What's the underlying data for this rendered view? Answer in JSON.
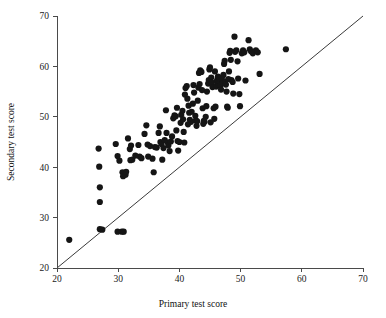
{
  "chart_data": {
    "type": "scatter",
    "title": "",
    "xlabel": "Primary test score",
    "ylabel": "Secondary test score",
    "xlim": [
      20,
      70
    ],
    "ylim": [
      20,
      70
    ],
    "xticks": [
      20,
      30,
      40,
      50,
      60,
      70
    ],
    "yticks": [
      20,
      30,
      40,
      50,
      60,
      70
    ],
    "xtick_labels": [
      "20",
      "30",
      "40",
      "50",
      "60",
      "70"
    ],
    "ytick_labels": [
      "20",
      "30",
      "40",
      "50",
      "60",
      "70"
    ],
    "grid": false,
    "legend": null,
    "marker": {
      "shape": "circle",
      "color": "#151515",
      "size_px": 3.1
    },
    "reference_line": {
      "name": "identity-line",
      "description": "45 degree line y = x",
      "x_start": 20,
      "y_start": 20,
      "x_end": 70,
      "y_end": 70,
      "color": "#3a3a3a",
      "width": 1
    },
    "n_points": 151,
    "points": [
      [
        22.0,
        25.6
      ],
      [
        26.8,
        43.7
      ],
      [
        26.9,
        40.1
      ],
      [
        27.0,
        36.0
      ],
      [
        27.0,
        33.1
      ],
      [
        27.0,
        27.7
      ],
      [
        27.4,
        27.6
      ],
      [
        29.9,
        27.2
      ],
      [
        30.6,
        27.2
      ],
      [
        30.9,
        27.2
      ],
      [
        29.6,
        44.6
      ],
      [
        29.9,
        42.2
      ],
      [
        30.2,
        41.3
      ],
      [
        30.7,
        39.0
      ],
      [
        30.8,
        38.2
      ],
      [
        31.2,
        38.5
      ],
      [
        31.3,
        39.1
      ],
      [
        31.6,
        45.7
      ],
      [
        31.9,
        43.6
      ],
      [
        32.0,
        41.4
      ],
      [
        32.3,
        41.5
      ],
      [
        32.1,
        44.3
      ],
      [
        33.3,
        44.4
      ],
      [
        33.5,
        42.1
      ],
      [
        34.3,
        46.6
      ],
      [
        34.6,
        48.3
      ],
      [
        34.8,
        44.5
      ],
      [
        35.2,
        44.2
      ],
      [
        35.6,
        41.7
      ],
      [
        35.8,
        39.0
      ],
      [
        36.0,
        44.0
      ],
      [
        36.3,
        43.9
      ],
      [
        36.6,
        46.8
      ],
      [
        36.9,
        45.0
      ],
      [
        37.1,
        44.6
      ],
      [
        37.2,
        41.5
      ],
      [
        37.4,
        43.8
      ],
      [
        37.6,
        45.4
      ],
      [
        37.8,
        51.3
      ],
      [
        37.9,
        46.8
      ],
      [
        38.1,
        44.9
      ],
      [
        38.2,
        44.3
      ],
      [
        38.4,
        43.2
      ],
      [
        38.6,
        45.1
      ],
      [
        38.8,
        46.1
      ],
      [
        39.0,
        49.7
      ],
      [
        39.2,
        50.3
      ],
      [
        39.4,
        50.1
      ],
      [
        39.5,
        47.3
      ],
      [
        39.7,
        45.2
      ],
      [
        39.8,
        43.3
      ],
      [
        40.0,
        45.0
      ],
      [
        40.2,
        48.8
      ],
      [
        40.3,
        50.4
      ],
      [
        40.5,
        51.2
      ],
      [
        40.6,
        49.5
      ],
      [
        40.7,
        47.0
      ],
      [
        40.8,
        44.9
      ],
      [
        41.0,
        55.7
      ],
      [
        41.2,
        56.1
      ],
      [
        41.3,
        53.6
      ],
      [
        41.5,
        52.2
      ],
      [
        41.6,
        50.8
      ],
      [
        41.7,
        49.4
      ],
      [
        41.9,
        49.0
      ],
      [
        42.0,
        51.0
      ],
      [
        42.2,
        52.6
      ],
      [
        42.3,
        56.3
      ],
      [
        42.4,
        54.8
      ],
      [
        42.6,
        50.2
      ],
      [
        42.7,
        49.3
      ],
      [
        42.9,
        49.1
      ],
      [
        43.0,
        53.2
      ],
      [
        43.1,
        55.8
      ],
      [
        43.3,
        56.5
      ],
      [
        43.4,
        59.2
      ],
      [
        43.6,
        58.9
      ],
      [
        43.7,
        55.3
      ],
      [
        43.8,
        51.7
      ],
      [
        44.0,
        49.2
      ],
      [
        44.1,
        49.0
      ],
      [
        44.3,
        50.0
      ],
      [
        44.4,
        52.1
      ],
      [
        44.5,
        55.0
      ],
      [
        44.7,
        56.6
      ],
      [
        44.8,
        57.3
      ],
      [
        44.9,
        59.4
      ],
      [
        45.0,
        59.8
      ],
      [
        45.2,
        57.8
      ],
      [
        45.3,
        56.8
      ],
      [
        45.4,
        55.9
      ],
      [
        45.6,
        51.7
      ],
      [
        45.7,
        49.6
      ],
      [
        45.9,
        52.0
      ],
      [
        46.0,
        56.0
      ],
      [
        46.1,
        57.0
      ],
      [
        46.2,
        57.4
      ],
      [
        46.3,
        58.0
      ],
      [
        46.4,
        56.5
      ],
      [
        46.5,
        57.1
      ],
      [
        46.6,
        57.6
      ],
      [
        46.7,
        56.2
      ],
      [
        46.8,
        55.4
      ],
      [
        46.9,
        57.8
      ],
      [
        47.0,
        57.2
      ],
      [
        47.1,
        56.7
      ],
      [
        47.2,
        58.3
      ],
      [
        47.3,
        60.5
      ],
      [
        47.4,
        61.1
      ],
      [
        47.5,
        57.0
      ],
      [
        47.6,
        56.4
      ],
      [
        47.7,
        55.0
      ],
      [
        47.8,
        52.0
      ],
      [
        47.9,
        51.8
      ],
      [
        48.0,
        57.5
      ],
      [
        48.1,
        59.0
      ],
      [
        48.2,
        62.7
      ],
      [
        48.3,
        63.1
      ],
      [
        48.4,
        61.3
      ],
      [
        48.5,
        57.3
      ],
      [
        48.7,
        56.9
      ],
      [
        48.8,
        54.6
      ],
      [
        49.0,
        65.9
      ],
      [
        49.1,
        62.9
      ],
      [
        49.3,
        63.2
      ],
      [
        49.5,
        61.0
      ],
      [
        49.6,
        57.6
      ],
      [
        49.8,
        54.5
      ],
      [
        49.9,
        52.1
      ],
      [
        50.2,
        62.6
      ],
      [
        50.4,
        63.2
      ],
      [
        50.6,
        62.8
      ],
      [
        50.8,
        57.2
      ],
      [
        51.3,
        65.2
      ],
      [
        51.5,
        63.4
      ],
      [
        51.7,
        63.0
      ],
      [
        52.0,
        62.6
      ],
      [
        52.5,
        63.2
      ],
      [
        52.8,
        62.8
      ],
      [
        53.1,
        58.5
      ],
      [
        57.4,
        63.4
      ],
      [
        43.2,
        58.7
      ],
      [
        45.8,
        59.0
      ],
      [
        40.9,
        54.4
      ],
      [
        39.6,
        51.8
      ],
      [
        36.8,
        48.1
      ],
      [
        34.9,
        42.1
      ],
      [
        33.8,
        41.8
      ],
      [
        32.8,
        42.3
      ],
      [
        43.9,
        48.6
      ],
      [
        45.1,
        48.9
      ],
      [
        42.8,
        48.2
      ],
      [
        41.4,
        48.5
      ]
    ]
  }
}
